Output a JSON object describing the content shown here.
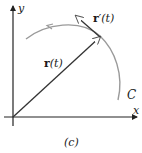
{
  "figure": {
    "caption": "(c)",
    "axes": {
      "x_label": "x",
      "y_label": "y"
    },
    "curve": {
      "label": "C",
      "color": "#9a9a9a"
    },
    "position_vector": {
      "label_bold": "r",
      "label_arg": "(t)",
      "color": "#333333"
    },
    "tangent_vector": {
      "label_bold": "r",
      "label_prime": "′",
      "label_arg": "(t)",
      "color": "#333333"
    }
  }
}
